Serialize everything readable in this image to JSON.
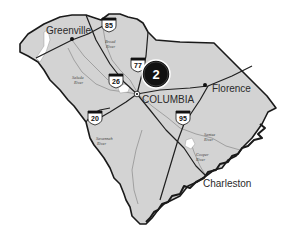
{
  "map": {
    "region": "South Carolina",
    "colors": {
      "land": "#d3d3d3",
      "border": "#1a1a1a",
      "road": "#1f1f1f",
      "river": "#8a8a8a",
      "lake": "#ffffff",
      "marker_fill": "#111111",
      "marker_ring": "#ffffff"
    },
    "cities": [
      {
        "name": "Greenville",
        "x": 72,
        "y": 38
      },
      {
        "name": "COLUMBIA",
        "x": 137,
        "y": 96
      },
      {
        "name": "Florence",
        "x": 208,
        "y": 88
      },
      {
        "name": "Charleston",
        "x": 202,
        "y": 187
      }
    ],
    "rivers": [
      {
        "label_line1": "Broad",
        "label_line2": "River",
        "x": 110,
        "y": 42
      },
      {
        "label_line1": "Saluda",
        "label_line2": "River",
        "x": 78,
        "y": 80
      },
      {
        "label_line1": "Savannah",
        "label_line2": "River",
        "x": 96,
        "y": 139
      },
      {
        "label_line1": "Santee",
        "label_line2": "River",
        "x": 205,
        "y": 135
      },
      {
        "label_line1": "Cooper",
        "label_line2": "River",
        "x": 197,
        "y": 155
      }
    ],
    "interstates": [
      {
        "number": "85",
        "x": 109,
        "y": 24
      },
      {
        "number": "77",
        "x": 138,
        "y": 64
      },
      {
        "number": "26",
        "x": 116,
        "y": 80
      },
      {
        "number": "20",
        "x": 95,
        "y": 117
      },
      {
        "number": "95",
        "x": 183,
        "y": 117
      }
    ],
    "marker": {
      "label": "2",
      "x": 156,
      "y": 74
    }
  }
}
